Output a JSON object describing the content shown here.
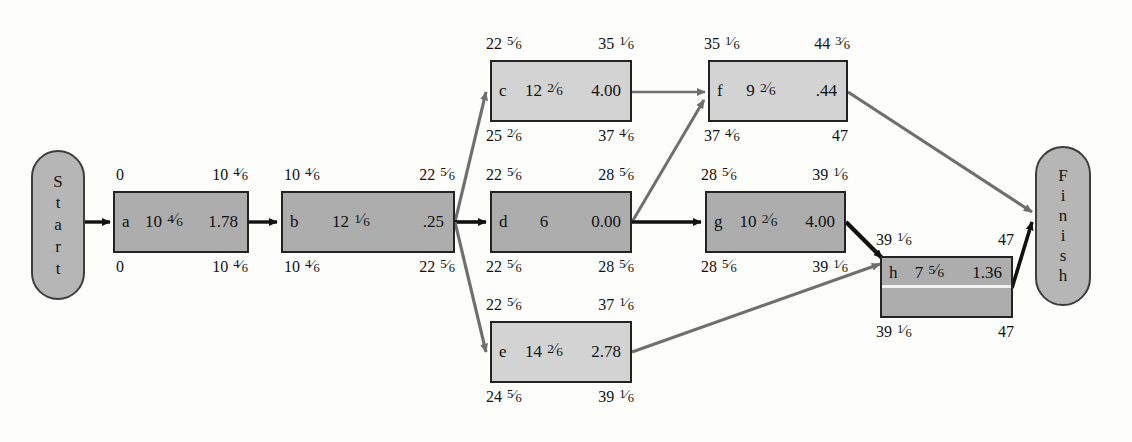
{
  "diagram": {
    "type": "pert-cpm-activity-on-node-network",
    "start_label": "Start",
    "finish_label": "Finish",
    "colors": {
      "critical_arrow": "#111111",
      "noncritical_arrow": "#6f6f6f",
      "node_border": "#232323",
      "node_fill_dark": "#adadad",
      "node_fill_light": "#d3d3d3",
      "terminal_fill": "#b6b6b6",
      "background": "#fdfdfb"
    }
  },
  "nodes": [
    {
      "id": "a",
      "duration": "10 4/6",
      "slack": "1.78",
      "es": "0",
      "ef": "10 4/6",
      "ls": "0",
      "lf": "10 4/6",
      "critical": true
    },
    {
      "id": "b",
      "duration": "12 1/6",
      "slack": ".25",
      "es": "10 4/6",
      "ef": "22 5/6",
      "ls": "10 4/6",
      "lf": "22 5/6",
      "critical": true
    },
    {
      "id": "c",
      "duration": "12 2/6",
      "slack": "4.00",
      "es": "22 5/6",
      "ef": "35 1/6",
      "ls": "25 2/6",
      "lf": "37 4/6",
      "critical": false
    },
    {
      "id": "d",
      "duration": "6",
      "slack": "0.00",
      "es": "22 5/6",
      "ef": "28 5/6",
      "ls": "22 5/6",
      "lf": "28 5/6",
      "critical": true
    },
    {
      "id": "e",
      "duration": "14 2/6",
      "slack": "2.78",
      "es": "22 5/6",
      "ef": "37 1/6",
      "ls": "24 5/6",
      "lf": "39 1/6",
      "critical": false
    },
    {
      "id": "f",
      "duration": "9 2/6",
      "slack": ".44",
      "es": "35 1/6",
      "ef": "44 3/6",
      "ls": "37 4/6",
      "lf": "47",
      "critical": false
    },
    {
      "id": "g",
      "duration": "10 2/6",
      "slack": "4.00",
      "es": "28 5/6",
      "ef": "39 1/6",
      "ls": "28 5/6",
      "lf": "39 1/6",
      "critical": true
    },
    {
      "id": "h",
      "duration": "7 5/6",
      "slack": "1.36",
      "es": "39 1/6",
      "ef": "47",
      "ls": "39 1/6",
      "lf": "47",
      "critical": true
    }
  ],
  "edges": [
    {
      "from": "Start",
      "to": "a",
      "critical": true
    },
    {
      "from": "a",
      "to": "b",
      "critical": true
    },
    {
      "from": "b",
      "to": "c",
      "critical": false
    },
    {
      "from": "b",
      "to": "d",
      "critical": true
    },
    {
      "from": "b",
      "to": "e",
      "critical": false
    },
    {
      "from": "c",
      "to": "f",
      "critical": false
    },
    {
      "from": "d",
      "to": "g",
      "critical": true
    },
    {
      "from": "d",
      "to": "f",
      "critical": false
    },
    {
      "from": "g",
      "to": "h",
      "critical": true
    },
    {
      "from": "e",
      "to": "h",
      "critical": false
    },
    {
      "from": "f",
      "to": "Finish",
      "critical": false
    },
    {
      "from": "h",
      "to": "Finish",
      "critical": true
    }
  ]
}
